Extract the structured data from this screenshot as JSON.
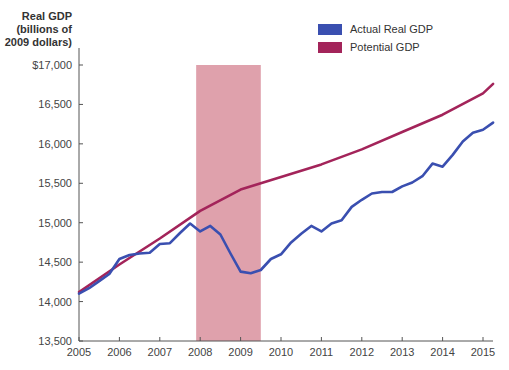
{
  "chart_data": {
    "type": "line",
    "title": "",
    "xlabel": "",
    "ylabel": "Real GDP (billions of 2009 dollars)",
    "ylabel_lines": [
      "Real GDP",
      "(billions of",
      "2009 dollars)"
    ],
    "xlim": [
      2005,
      2015.25
    ],
    "ylim": [
      13500,
      17000
    ],
    "x_ticks": [
      "2005",
      "2006",
      "2007",
      "2008",
      "2009",
      "2010",
      "2011",
      "2012",
      "2013",
      "2014",
      "2015"
    ],
    "y_ticks": [
      "13,500",
      "14,000",
      "14,500",
      "15,000",
      "15,500",
      "16,000",
      "16,500",
      "$17,000"
    ],
    "y_tick_values": [
      13500,
      14000,
      14500,
      15000,
      15500,
      16000,
      16500,
      17000
    ],
    "grid": false,
    "legend_position": "top-right",
    "shaded_region": {
      "label": "Recession",
      "x_start": 2007.9,
      "x_end": 2009.5,
      "color": "#d9919e"
    },
    "series": [
      {
        "name": "Actual Real GDP",
        "color": "#3a4fb0",
        "x": [
          2005.0,
          2005.25,
          2005.5,
          2005.75,
          2006.0,
          2006.25,
          2006.5,
          2006.75,
          2007.0,
          2007.25,
          2007.5,
          2007.75,
          2008.0,
          2008.25,
          2008.5,
          2008.75,
          2009.0,
          2009.25,
          2009.5,
          2009.75,
          2010.0,
          2010.25,
          2010.5,
          2010.75,
          2011.0,
          2011.25,
          2011.5,
          2011.75,
          2012.0,
          2012.25,
          2012.5,
          2012.75,
          2013.0,
          2013.25,
          2013.5,
          2013.75,
          2014.0,
          2014.25,
          2014.5,
          2014.75,
          2015.0,
          2015.25
        ],
        "values": [
          14100,
          14170,
          14260,
          14350,
          14540,
          14590,
          14610,
          14620,
          14730,
          14740,
          14870,
          14990,
          14890,
          14960,
          14850,
          14610,
          14380,
          14360,
          14400,
          14540,
          14600,
          14750,
          14860,
          14960,
          14890,
          14990,
          15030,
          15200,
          15290,
          15370,
          15390,
          15390,
          15460,
          15510,
          15590,
          15750,
          15710,
          15860,
          16030,
          16140,
          16180,
          16270
        ]
      },
      {
        "name": "Potential GDP",
        "color": "#a3245a",
        "x": [
          2005.0,
          2006.0,
          2007.0,
          2008.0,
          2009.0,
          2010.0,
          2011.0,
          2012.0,
          2013.0,
          2014.0,
          2015.0,
          2015.25
        ],
        "values": [
          14120,
          14470,
          14800,
          15150,
          15420,
          15580,
          15740,
          15930,
          16150,
          16370,
          16640,
          16760
        ]
      }
    ]
  },
  "legend": {
    "items": [
      {
        "label": "Actual Real GDP",
        "color": "#3a4fb0"
      },
      {
        "label": "Potential GDP",
        "color": "#a3245a"
      }
    ]
  },
  "axis": {
    "ylabel_line1": "Real GDP",
    "ylabel_line2": "(billions of",
    "ylabel_line3": "2009 dollars)"
  }
}
